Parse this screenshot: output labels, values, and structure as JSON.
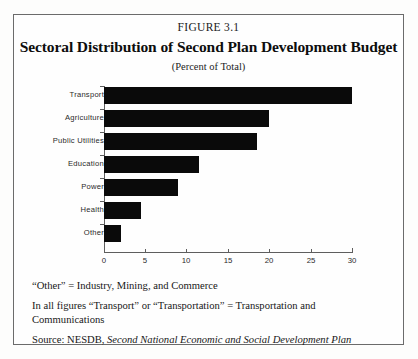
{
  "figure": {
    "number": "FIGURE 3.1",
    "title": "Sectoral Distribution of Second Plan Development Budget",
    "subtitle": "(Percent of Total)"
  },
  "footnotes": {
    "note_other": "“Other” = Industry, Mining, and Commerce",
    "note_transport": "In all figures “Transport” or “Transportation” = Transportation and Communications",
    "source_prefix": "Source: NESDB, ",
    "source_title": "Second National Economic and Social Development Plan"
  },
  "chart_data": {
    "type": "bar",
    "orientation": "horizontal",
    "title": "Sectoral Distribution of Second Plan Development Budget",
    "subtitle": "(Percent of Total)",
    "xlabel": "",
    "ylabel": "",
    "categories": [
      "Transport",
      "Agriculture",
      "Public  Utilities",
      "Education",
      "Power",
      "Health",
      "Other"
    ],
    "values": [
      30,
      20,
      18.5,
      11.5,
      9,
      4.5,
      2
    ],
    "xlim": [
      0,
      30
    ],
    "xticks": [
      0,
      5,
      10,
      15,
      20,
      25,
      30
    ],
    "xtick_labels": [
      "0",
      "5",
      "10",
      "15",
      "20",
      "25",
      "30"
    ],
    "grid": false,
    "legend": false,
    "bar_color": "#0a0a0a",
    "axis_color": "#5e5e5e"
  }
}
